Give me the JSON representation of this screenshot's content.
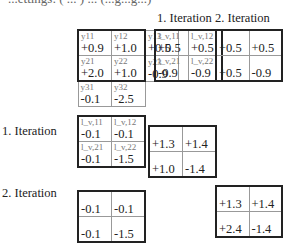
{
  "top_cut_text": "...ettings: ( ... ) ... (...g...g...)",
  "headers": {
    "iter1": "1. Iteration",
    "iter2": "2. Iteration"
  },
  "row_labels": {
    "iter1": "1. Iteration",
    "iter2": "2. Iteration"
  },
  "y_matrix": {
    "rows": [
      [
        {
          "sub": "y11",
          "val": "+0.9"
        },
        {
          "sub": "y12",
          "val": "+1.0"
        },
        {
          "sub": "y13",
          "val": "+0.5"
        }
      ],
      [
        {
          "sub": "y21",
          "val": "+2.0"
        },
        {
          "sub": "y22",
          "val": "+1.0"
        },
        {
          "sub": "y23",
          "val": "-0.9"
        }
      ],
      [
        {
          "sub": "y31",
          "val": "-0.1"
        },
        {
          "sub": "y32",
          "val": "-2.5"
        }
      ]
    ]
  },
  "l_top": {
    "rows": [
      [
        {
          "sub": "l_v,11",
          "val": "+0.5"
        },
        {
          "sub": "l_v,12",
          "val": "+0.5"
        }
      ],
      [
        {
          "sub": "l_v,21",
          "val": "-0.9"
        },
        {
          "sub": "l_v,22",
          "val": "-0.9"
        }
      ]
    ]
  },
  "top_iter2": {
    "rows": [
      [
        "+0.5",
        "+0.5"
      ],
      [
        "+0.5",
        "-0.9"
      ]
    ]
  },
  "l_left": {
    "rows": [
      [
        {
          "sub": "l_v,11",
          "val": "-0.1"
        },
        {
          "sub": "l_v,12",
          "val": "-0.1"
        }
      ],
      [
        {
          "sub": "l_v,21",
          "val": "-0.1"
        },
        {
          "sub": "l_v,22",
          "val": "-1.5"
        }
      ]
    ]
  },
  "center_iter1": {
    "rows": [
      [
        "+1.3",
        "+1.4"
      ],
      [
        "+1.0",
        "-1.4"
      ]
    ]
  },
  "left_iter2": {
    "rows": [
      [
        "-0.1",
        "-0.1"
      ],
      [
        "-0.1",
        "-1.5"
      ]
    ]
  },
  "right_iter2": {
    "rows": [
      [
        "+1.3",
        "+1.4"
      ],
      [
        "+2.4",
        "-1.4"
      ]
    ]
  }
}
